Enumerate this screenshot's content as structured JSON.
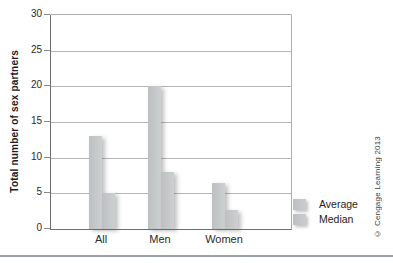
{
  "figure": {
    "credit": "© Cengage Learning 2013"
  },
  "chart_data": {
    "type": "bar",
    "title": "",
    "xlabel": "",
    "ylabel": "Total number of sex partners",
    "categories": [
      "All",
      "Men",
      "Women"
    ],
    "series": [
      {
        "name": "Average",
        "values": [
          13,
          20,
          6.5
        ]
      },
      {
        "name": "Median",
        "values": [
          5,
          8,
          2.7
        ]
      }
    ],
    "ylim": [
      0,
      30
    ],
    "yticks": [
      0,
      5,
      10,
      15,
      20,
      25,
      30
    ],
    "grid": true,
    "legend_position": "bottom-right",
    "bar_color": "#c2c6c8",
    "gridline_color": "#b7b7b7"
  }
}
